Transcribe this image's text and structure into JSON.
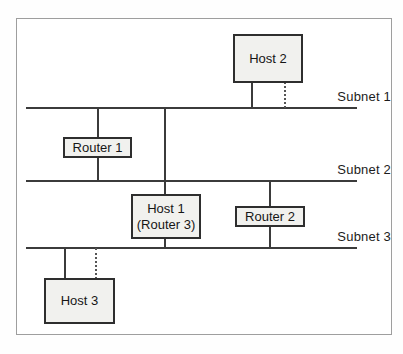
{
  "diagram": {
    "type": "network-topology",
    "subnets": [
      {
        "label": "Subnet 1"
      },
      {
        "label": "Subnet 2"
      },
      {
        "label": "Subnet 3"
      }
    ],
    "nodes": [
      {
        "id": "host2",
        "label": "Host 2"
      },
      {
        "id": "router1",
        "label": "Router 1"
      },
      {
        "id": "host1",
        "label": "Host 1",
        "sublabel": "(Router 3)"
      },
      {
        "id": "router2",
        "label": "Router 2"
      },
      {
        "id": "host3",
        "label": "Host 3"
      }
    ],
    "edges": [
      {
        "from": "Host 2",
        "to": "Subnet 1",
        "style": "solid"
      },
      {
        "from": "Host 2",
        "to": "Subnet 1",
        "style": "dotted"
      },
      {
        "from": "Router 1",
        "to": "Subnet 1",
        "style": "solid"
      },
      {
        "from": "Router 1",
        "to": "Subnet 2",
        "style": "solid"
      },
      {
        "from": "Host 1 (Router 3)",
        "to": "Subnet 1",
        "style": "solid"
      },
      {
        "from": "Host 1 (Router 3)",
        "to": "Subnet 3",
        "style": "solid"
      },
      {
        "from": "Router 2",
        "to": "Subnet 2",
        "style": "solid"
      },
      {
        "from": "Router 2",
        "to": "Subnet 3",
        "style": "solid"
      },
      {
        "from": "Host 3",
        "to": "Subnet 3",
        "style": "solid"
      },
      {
        "from": "Host 3",
        "to": "Subnet 3",
        "style": "dotted"
      }
    ],
    "colors": {
      "box_fill": "#f1f1ee",
      "box_border": "#2e2e2e",
      "line": "#3b3b3b",
      "frame": "#9e9e9e",
      "text": "#1c1c1c",
      "background": "#ffffff"
    }
  }
}
